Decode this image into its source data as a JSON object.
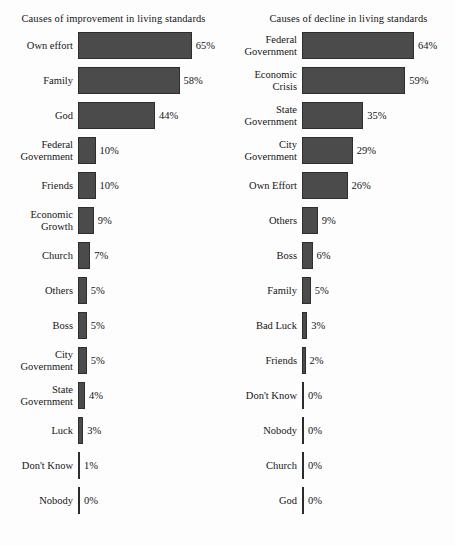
{
  "chart_data": [
    {
      "type": "bar",
      "orientation": "horizontal",
      "title": "Causes of improvement in living standards",
      "xlabel": "",
      "ylabel": "",
      "grid": false,
      "legend": "none",
      "xlim": [
        0,
        65
      ],
      "value_suffix": "%",
      "categories": [
        "Own effort",
        "Family",
        "God",
        "Federal Government",
        "Friends",
        "Economic Growth",
        "Church",
        "Others",
        "Boss",
        "City Government",
        "State Government",
        "Luck",
        "Don't Know",
        "Nobody"
      ],
      "values": [
        65,
        58,
        44,
        10,
        10,
        9,
        7,
        5,
        5,
        5,
        4,
        3,
        1,
        0
      ],
      "value_labels": [
        "65%",
        "58%",
        "44%",
        "10%",
        "10%",
        "9%",
        "7%",
        "5%",
        "5%",
        "5%",
        "4%",
        "3%",
        "1%",
        "0%"
      ],
      "category_lines": [
        [
          "Own effort"
        ],
        [
          "Family"
        ],
        [
          "God"
        ],
        [
          "Federal",
          "Government"
        ],
        [
          "Friends"
        ],
        [
          "Economic",
          "Growth"
        ],
        [
          "Church"
        ],
        [
          "Others"
        ],
        [
          "Boss"
        ],
        [
          "City",
          "Government"
        ],
        [
          "State",
          "Government"
        ],
        [
          "Luck"
        ],
        [
          "Don't Know"
        ],
        [
          "Nobody"
        ]
      ]
    },
    {
      "type": "bar",
      "orientation": "horizontal",
      "title": "Causes of decline in living standards",
      "xlabel": "",
      "ylabel": "",
      "grid": false,
      "legend": "none",
      "xlim": [
        0,
        64
      ],
      "value_suffix": "%",
      "categories": [
        "Federal Government",
        "Economic Crisis",
        "State Government",
        "City Government",
        "Own Effort",
        "Others",
        "Boss",
        "Family",
        "Bad Luck",
        "Friends",
        "Don't Know",
        "Nobody",
        "Church",
        "God"
      ],
      "values": [
        64,
        59,
        35,
        29,
        26,
        9,
        6,
        5,
        3,
        2,
        0,
        0,
        0,
        0
      ],
      "value_labels": [
        "64%",
        "59%",
        "35%",
        "29%",
        "26%",
        "9%",
        "6%",
        "5%",
        "3%",
        "2%",
        "0%",
        "0%",
        "0%",
        "0%"
      ],
      "category_lines": [
        [
          "Federal",
          "Government"
        ],
        [
          "Economic",
          "Crisis"
        ],
        [
          "State",
          "Government"
        ],
        [
          "City",
          "Government"
        ],
        [
          "Own Effort"
        ],
        [
          "Others"
        ],
        [
          "Boss"
        ],
        [
          "Family"
        ],
        [
          "Bad Luck"
        ],
        [
          "Friends"
        ],
        [
          "Don't Know"
        ],
        [
          "Nobody"
        ],
        [
          "Church"
        ],
        [
          "God"
        ]
      ]
    }
  ],
  "style": {
    "bar_color": "#4b4b4b",
    "bar_border_color": "#2e2e2e",
    "text_color": "#151515",
    "background": "#fdfdfd"
  },
  "layout": {
    "left_panel": {
      "label_width": 76,
      "bar_origin": 78,
      "px_per_percent": 1.75
    },
    "right_panel": {
      "label_width": 72,
      "bar_origin": 74,
      "px_per_percent": 1.75
    }
  }
}
